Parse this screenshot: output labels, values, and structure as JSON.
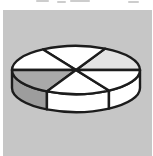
{
  "page": {
    "background_color": "#ffffff",
    "canvas": {
      "background_color": "#c6c6c6",
      "left": 3,
      "top": 10,
      "width": 149,
      "height": 146
    },
    "top_artifact_color": "#cdcdcd"
  },
  "chart_data": {
    "type": "pie",
    "style": "3d-clipart-no-labels",
    "title": "",
    "labels": [],
    "legend_visible": false,
    "values_percent": [
      17.5,
      16.1,
      16.4,
      17.5,
      16.1,
      16.4
    ],
    "slices": [
      {
        "start_angle": 0,
        "end_angle": 63,
        "color": "#e3e3e3"
      },
      {
        "start_angle": 63,
        "end_angle": 121,
        "color": "#ffffff"
      },
      {
        "start_angle": 121,
        "end_angle": 180,
        "color": "#ffffff"
      },
      {
        "start_angle": 180,
        "end_angle": 243,
        "color": "#a9a9a9"
      },
      {
        "start_angle": 243,
        "end_angle": 301,
        "color": "#ffffff"
      },
      {
        "start_angle": 301,
        "end_angle": 360,
        "color": "#ffffff"
      }
    ],
    "rim": {
      "visible_from_angle": 180,
      "visible_to_angle": 360,
      "colors": [
        "#9d9d9d",
        "#ffffff",
        "#ffffff"
      ]
    },
    "layout": {
      "cx": 73,
      "cy": 60,
      "rx": 64,
      "ry": 24,
      "depth": 18,
      "outline_color": "#1c1c1c",
      "outline_width": 2.4
    }
  }
}
